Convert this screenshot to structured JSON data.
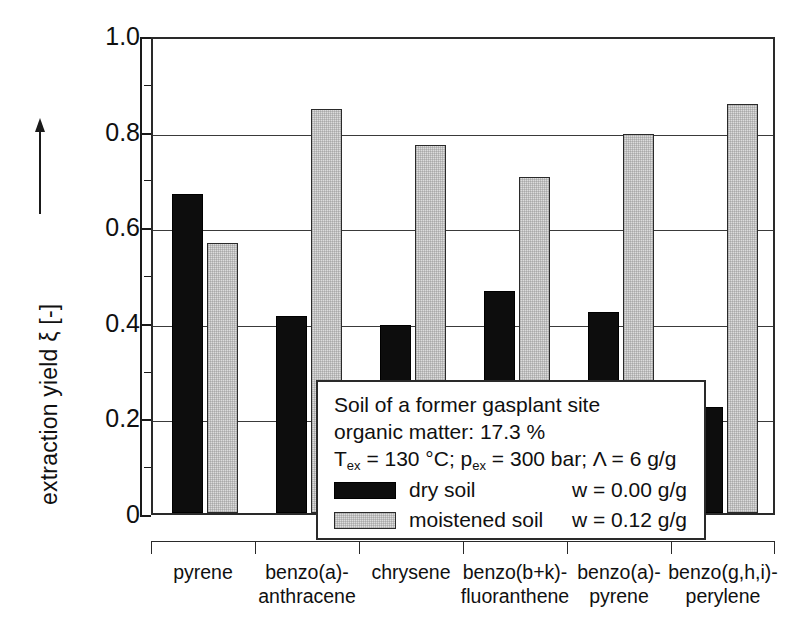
{
  "chart_data": {
    "type": "bar",
    "title": "",
    "xlabel": "",
    "ylabel": "extraction yield ξ [-]",
    "ylim": [
      0,
      1.0
    ],
    "grid": true,
    "legend_position": "inside-lower-left",
    "categories": [
      "pyrene",
      "benzo(a)-\nanthracene",
      "chrysene",
      "benzo(b+k)-\nfluoranthene",
      "benzo(a)-\npyrene",
      "benzo(g,h,i)-\nperylene"
    ],
    "category_lines": [
      [
        "pyrene",
        ""
      ],
      [
        "benzo(a)-",
        "anthracene"
      ],
      [
        "chrysene",
        ""
      ],
      [
        "benzo(b+k)-",
        "fluoranthene"
      ],
      [
        "benzo(a)-",
        "pyrene"
      ],
      [
        "benzo(g,h,i)-",
        "perylene"
      ]
    ],
    "series": [
      {
        "name": "dry soil",
        "color": "#0d0d0d",
        "values": [
          0.667,
          0.412,
          0.394,
          0.465,
          0.421,
          0.221
        ]
      },
      {
        "name": "moistened soil",
        "color": "#dcdcdc",
        "values": [
          0.564,
          0.845,
          0.77,
          0.702,
          0.792,
          0.855
        ]
      }
    ],
    "yticks": [
      0,
      0.2,
      0.4,
      0.6,
      0.8,
      1.0
    ],
    "ytick_labels": [
      "0",
      "0.2",
      "0.4",
      "0.6",
      "0.8",
      "1.0"
    ],
    "yminor_ticks": [
      0.1,
      0.3,
      0.5,
      0.7,
      0.9
    ],
    "gridlines": [
      0.2,
      0.4,
      0.6,
      0.8
    ]
  },
  "axis": {
    "y_title": "extraction yield ξ [-]",
    "y_arrow_icon": "up-arrow-icon"
  },
  "legend": {
    "line1": "Soil of a former gasplant site",
    "line2": "organic matter:  17.3 %",
    "line3_prefix": "T",
    "line3_sub1": "ex",
    "line3_mid": " = 130 °C; p",
    "line3_sub2": "ex",
    "line3_suffix": " = 300 bar; Λ = 6 g/g",
    "rows": [
      {
        "swatch": "dry-soil-swatch",
        "name": "dry soil",
        "value": "w = 0.00 g/g"
      },
      {
        "swatch": "moistened-soil-swatch",
        "name": "moistened soil",
        "value": "w = 0.12 g/g"
      }
    ]
  }
}
